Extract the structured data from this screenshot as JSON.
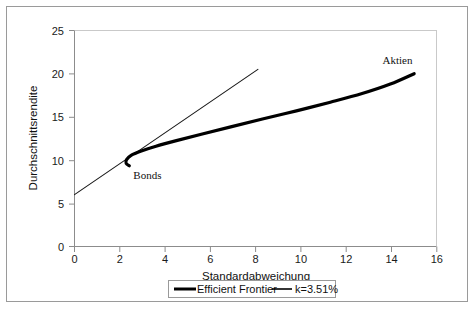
{
  "chart_data": {
    "type": "line",
    "title": "",
    "xlabel": "Standardabweichung",
    "ylabel": "Durchschnittsrendite",
    "xlim": [
      0,
      16
    ],
    "ylim": [
      0,
      25
    ],
    "xticks": [
      "0",
      "2",
      "4",
      "6",
      "8",
      "10",
      "12",
      "14",
      "16"
    ],
    "yticks": [
      "0",
      "5",
      "10",
      "15",
      "20",
      "25"
    ],
    "grid": false,
    "legend_position": "bottom-center",
    "series": [
      {
        "name": "Efficient Frontier",
        "style": "thick-solid-black",
        "color": "#000000",
        "points": [
          [
            2.42,
            9.35
          ],
          [
            2.28,
            9.62
          ],
          [
            2.3,
            10.05
          ],
          [
            2.5,
            10.55
          ],
          [
            2.95,
            11.05
          ],
          [
            3.6,
            11.6
          ],
          [
            4.5,
            12.25
          ],
          [
            5.6,
            13.0
          ],
          [
            6.9,
            13.85
          ],
          [
            8.3,
            14.75
          ],
          [
            9.8,
            15.7
          ],
          [
            11.3,
            16.7
          ],
          [
            12.7,
            17.7
          ],
          [
            13.95,
            18.8
          ],
          [
            15.0,
            20.0
          ]
        ]
      },
      {
        "name": "k=3.51%",
        "style": "thin-solid-black",
        "color": "#000000",
        "points": [
          [
            0.0,
            6.0
          ],
          [
            8.1,
            20.5
          ]
        ]
      }
    ],
    "annotations": [
      {
        "text": "Bonds",
        "x": 2.6,
        "y": 7.8
      },
      {
        "text": "Aktien",
        "x": 13.6,
        "y": 21.1
      }
    ],
    "legend": [
      {
        "label": "Efficient Frontier",
        "swatch": "thick-line",
        "color": "#000000"
      },
      {
        "label": "k=3.51%",
        "swatch": "thin-line",
        "color": "#000000"
      }
    ]
  },
  "axes": {
    "x_title": "Standardabweichung",
    "y_title": "Durchschnittsrendite"
  },
  "colors": {
    "series": "#000000",
    "axis": "#808080",
    "frame": "#9a9a9a",
    "text": "#111111"
  }
}
